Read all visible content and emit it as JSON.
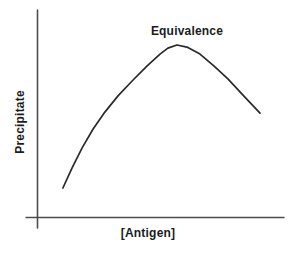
{
  "figure": {
    "x_axis_label": "[Antigen]",
    "y_axis_label": "Precipitate",
    "peak_annotation": "Equivalence"
  },
  "colors": {
    "background": "#ffffff",
    "curve": "#2a2a2a",
    "axis": "#4d4d4d",
    "text": "#1c1c1c"
  },
  "chart_data": {
    "type": "line",
    "title": "",
    "xlabel": "[Antigen]",
    "ylabel": "Precipitate",
    "annotations": [
      {
        "text": "Equivalence",
        "target": "curve-peak"
      }
    ],
    "axes": {
      "x_ticks": "none (unlabeled conceptual axis)",
      "y_ticks": "none (unlabeled conceptual axis)",
      "x_range_norm": [
        0,
        1
      ],
      "y_range_norm": [
        0,
        1
      ],
      "grid": false
    },
    "legend": "none",
    "series": [
      {
        "name": "precipitin-curve",
        "units": "normalized (0-1) fraction of axis length; axes are unlabeled",
        "points": [
          [
            0.105,
            0.14
          ],
          [
            0.142,
            0.237
          ],
          [
            0.182,
            0.333
          ],
          [
            0.227,
            0.425
          ],
          [
            0.275,
            0.507
          ],
          [
            0.328,
            0.585
          ],
          [
            0.385,
            0.657
          ],
          [
            0.445,
            0.729
          ],
          [
            0.498,
            0.787
          ],
          [
            0.53,
            0.816
          ],
          [
            0.567,
            0.831
          ],
          [
            0.607,
            0.821
          ],
          [
            0.66,
            0.787
          ],
          [
            0.717,
            0.729
          ],
          [
            0.773,
            0.667
          ],
          [
            0.834,
            0.589
          ],
          [
            0.903,
            0.502
          ]
        ]
      }
    ]
  }
}
